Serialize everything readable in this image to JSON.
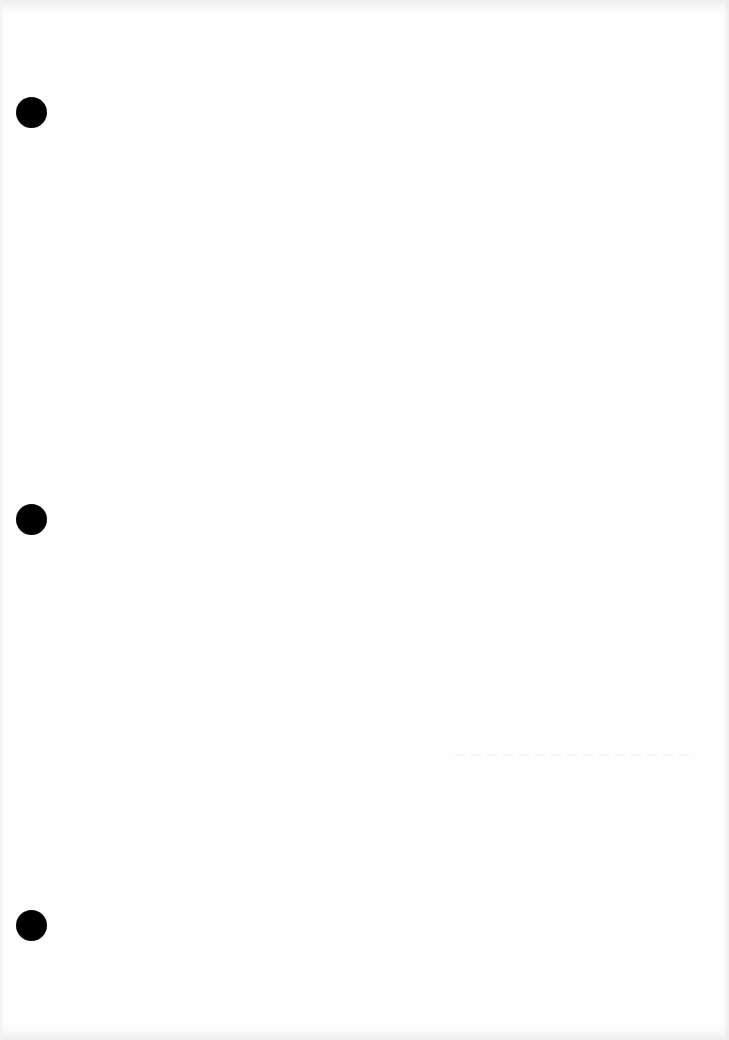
{
  "page": {
    "type": "blank scanned sheet",
    "background_color": "#fefefe",
    "content_text": ""
  },
  "punch_holes": [
    {
      "name": "top",
      "center_x": 31,
      "center_y": 112,
      "diameter": 31,
      "color": "#000000"
    },
    {
      "name": "middle",
      "center_x": 31,
      "center_y": 519,
      "diameter": 31,
      "color": "#000000"
    },
    {
      "name": "bottom",
      "center_x": 31,
      "center_y": 925,
      "diameter": 31,
      "color": "#000000"
    }
  ]
}
